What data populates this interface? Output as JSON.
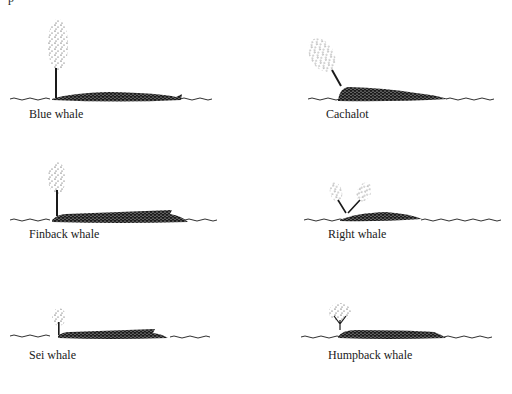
{
  "figure": {
    "top_cut_text": "p",
    "colors": {
      "ink": "#1a1a1a",
      "background": "#ffffff"
    },
    "whales": [
      {
        "id": "blue",
        "label": "Blue whale",
        "spout": "tall single vertical column"
      },
      {
        "id": "cachalot",
        "label": "Cachalot",
        "spout": "single spout angled forward-left"
      },
      {
        "id": "finback",
        "label": "Finback whale",
        "spout": "tall narrow vertical column"
      },
      {
        "id": "right",
        "label": "Right whale",
        "spout": "double V-shaped spout"
      },
      {
        "id": "sei",
        "label": "Sei whale",
        "spout": "short vertical bushy column"
      },
      {
        "id": "humpback",
        "label": "Humpback whale",
        "spout": "short bushy tree-shaped spout"
      }
    ]
  }
}
